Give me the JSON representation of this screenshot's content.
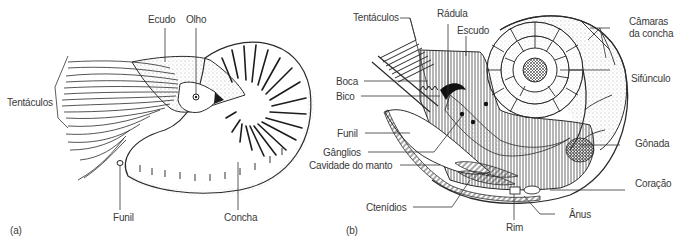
{
  "figure": {
    "colors": {
      "ink": "#2a2a2a",
      "label": "#3a3a3a",
      "background": "#ffffff"
    }
  },
  "panel_a": {
    "tag": "(a)",
    "labels": {
      "tentaculos": "Tentáculos",
      "ecudo": "Ecudo",
      "olho": "Olho",
      "funil": "Funil",
      "concha": "Concha"
    }
  },
  "panel_b": {
    "tag": "(b)",
    "labels": {
      "tentaculos": "Tentáculos",
      "radula": "Rádula",
      "escudo": "Escudo",
      "camaras_line1": "Câmaras",
      "camaras_line2": "da concha",
      "sifunculo": "Sifúnculo",
      "boca": "Boca",
      "bico": "Bico",
      "funil": "Funil",
      "ganglios": "Gânglios",
      "cavidade_manto": "Cavidade do manto",
      "gonada": "Gônada",
      "coracao": "Coração",
      "ctenidios": "Ctenídios",
      "rim": "Rim",
      "anus": "Ânus"
    }
  }
}
